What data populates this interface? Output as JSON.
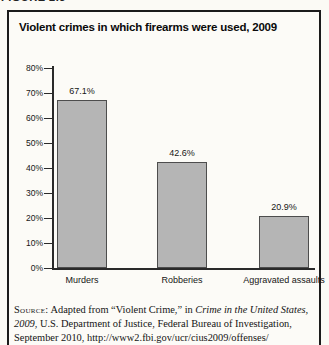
{
  "figure_label": "FIGURE 2.3",
  "chart_data": {
    "type": "bar",
    "title": "Violent crimes in which firearms were used, 2009",
    "categories": [
      "Murders",
      "Robberies",
      "Aggravated assaults"
    ],
    "values": [
      67.1,
      42.6,
      20.9
    ],
    "value_labels": [
      "67.1%",
      "42.6%",
      "20.9%"
    ],
    "xlabel": "",
    "ylabel": "",
    "ylim": [
      0,
      80
    ],
    "ytick_step": 10,
    "ytick_labels": [
      "0%",
      "10%",
      "20%",
      "30%",
      "40%",
      "50%",
      "60%",
      "70%",
      "80%"
    ],
    "grid": false,
    "legend": "none",
    "bar_fill": "#b5b5b5",
    "bar_border": "#4d4d4d"
  },
  "source": {
    "lines": [
      {
        "segments": [
          {
            "text": "Source:",
            "smallcaps": true,
            "italic": false
          },
          {
            "text": " Adapted from “Violent Crime,” in ",
            "smallcaps": false,
            "italic": false
          },
          {
            "text": "Crime in the United States,",
            "smallcaps": false,
            "italic": true
          }
        ]
      },
      {
        "segments": [
          {
            "text": "2009",
            "smallcaps": false,
            "italic": true
          },
          {
            "text": ", U.S. Department of Justice, Federal Bureau of Investigation,",
            "smallcaps": false,
            "italic": false
          }
        ]
      },
      {
        "segments": [
          {
            "text": "September 2010, http://www2.fbi.gov/ucr/cius2009/offenses/",
            "smallcaps": false,
            "italic": false
          }
        ]
      }
    ]
  }
}
